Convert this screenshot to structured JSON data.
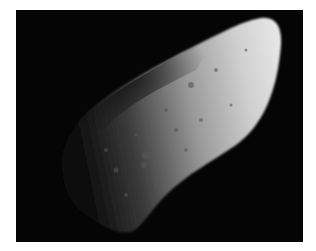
{
  "image": {
    "subject": "asteroid",
    "description": "Grayscale photograph of an elongated cratered asteroid against black space",
    "colors": {
      "background": "#050505",
      "border": "#ffffff",
      "lit": "#e0e0e0",
      "shadow": "#1a1a1a"
    }
  }
}
